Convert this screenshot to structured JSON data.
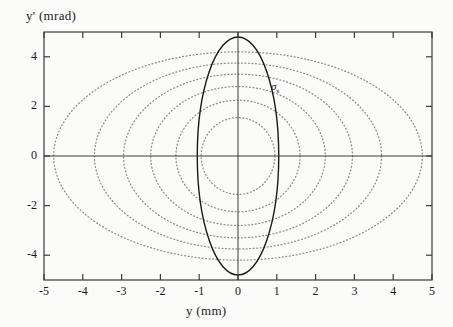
{
  "figure": {
    "title": "",
    "background_color": "#fbfbfa",
    "axis_color": "#3a3a3a",
    "solid_curve_color": "#1a1a1a",
    "dotted_curve_color": "#8a8a8a"
  },
  "annotations": [
    {
      "name": "sigma-label",
      "symbol": "σ",
      "subscript": "s",
      "x": 1.45,
      "y": 2.75
    }
  ],
  "chart_data": {
    "type": "line",
    "title": "",
    "xlabel": "y  (mm)",
    "ylabel": "y'  (mrad)",
    "xlim": [
      -5,
      5
    ],
    "ylim": [
      -5,
      5
    ],
    "xticks": [
      -5,
      -4,
      -3,
      -2,
      -1,
      0,
      1,
      2,
      3,
      4,
      5
    ],
    "xticklabels": [
      "-5",
      "-4",
      "-3",
      "-2",
      "-1",
      "0",
      "1",
      "2",
      "3",
      "4",
      "5"
    ],
    "yticks": [
      -4,
      -2,
      0,
      2,
      4
    ],
    "yticklabels": [
      "-4",
      "-2",
      "0",
      "2",
      "4"
    ],
    "grid": false,
    "legend": "none",
    "zero_lines": {
      "horizontal": 0,
      "vertical": 0
    },
    "series": [
      {
        "name": "ellipse-1-dotted",
        "style": "dotted",
        "semi_x": 0.95,
        "semi_y": 1.55,
        "color": "#8a8a8a"
      },
      {
        "name": "ellipse-2-dotted",
        "style": "dotted",
        "semi_x": 1.6,
        "semi_y": 2.25,
        "color": "#8a8a8a"
      },
      {
        "name": "ellipse-3-dotted",
        "style": "dotted",
        "semi_x": 2.25,
        "semi_y": 2.8,
        "color": "#8a8a8a"
      },
      {
        "name": "ellipse-4-dotted",
        "style": "dotted",
        "semi_x": 2.95,
        "semi_y": 3.3,
        "color": "#8a8a8a"
      },
      {
        "name": "ellipse-5-dotted",
        "style": "dotted",
        "semi_x": 3.7,
        "semi_y": 3.75,
        "color": "#8a8a8a"
      },
      {
        "name": "ellipse-6-dotted",
        "style": "dotted",
        "semi_x": 4.75,
        "semi_y": 4.2,
        "color": "#8a8a8a"
      },
      {
        "name": "ellipse-sigma-solid",
        "style": "solid",
        "semi_x": 1.05,
        "semi_y": 4.8,
        "color": "#1a1a1a"
      }
    ]
  }
}
